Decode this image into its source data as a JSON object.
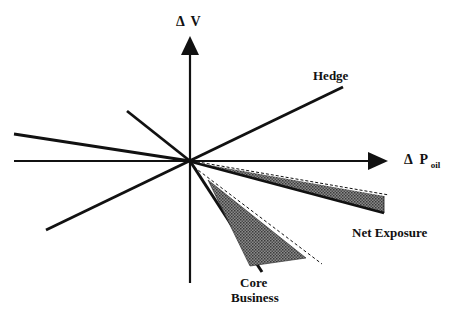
{
  "diagram": {
    "type": "risk-exposure-vector-diagram",
    "colors": {
      "line": "#111111",
      "shade": "#6e6e6e",
      "background": "#ffffff"
    },
    "axes": {
      "y_label_prefix": "Δ",
      "y_label_main": "V",
      "x_label_prefix": "Δ",
      "x_label_main": "P",
      "x_label_sub": "oil"
    },
    "labels": {
      "hedge": "Hedge",
      "net_exposure": "Net Exposure",
      "core_business_line1": "Core",
      "core_business_line2": "Business"
    }
  }
}
